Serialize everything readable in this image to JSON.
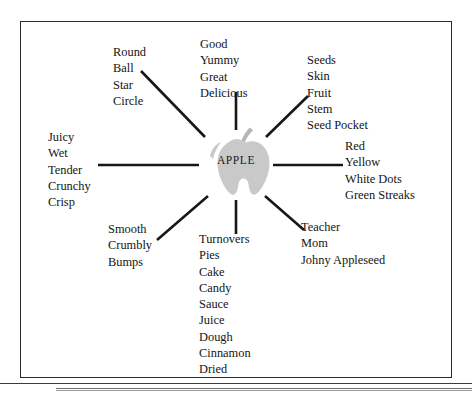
{
  "diagram": {
    "type": "semantic-web",
    "center": {
      "label": "APPLE",
      "shape": "apple-silhouette",
      "fill_color": "#c9c9c9",
      "stem_color": "#b5b5b5"
    },
    "frame": {
      "border_color": "#2b2b2b",
      "background_color": "#ffffff"
    },
    "spoke_color": "#171717",
    "spoke_count": 8,
    "branches": [
      {
        "id": "shape",
        "name": "shape-branch",
        "direction": "top-left",
        "words": [
          "Round",
          "Ball",
          "Star",
          "Circle"
        ]
      },
      {
        "id": "taste",
        "name": "taste-branch",
        "direction": "top",
        "words": [
          "Good",
          "Yummy",
          "Great",
          "Delicious"
        ]
      },
      {
        "id": "parts",
        "name": "parts-branch",
        "direction": "top-right",
        "words": [
          "Seeds",
          "Skin",
          "Fruit",
          "Stem",
          "Seed Pocket"
        ]
      },
      {
        "id": "texture",
        "name": "texture-branch",
        "direction": "left",
        "words": [
          "Juicy",
          "Wet",
          "Tender",
          "Crunchy",
          "Crisp"
        ]
      },
      {
        "id": "color",
        "name": "color-branch",
        "direction": "right",
        "words": [
          "Red",
          "Yellow",
          "White Dots",
          "Green Streaks"
        ]
      },
      {
        "id": "feel",
        "name": "feel-branch",
        "direction": "bottom-left",
        "words": [
          "Smooth",
          "Crumbly",
          "Bumps"
        ]
      },
      {
        "id": "foods",
        "name": "foods-branch",
        "direction": "bottom",
        "words": [
          "Turnovers",
          "Pies",
          "Cake",
          "Candy",
          "Sauce",
          "Juice",
          "Dough",
          "Cinnamon",
          "Dried"
        ]
      },
      {
        "id": "people",
        "name": "people-branch",
        "direction": "bottom-right",
        "words": [
          "Teacher",
          "Mom",
          "Johny Appleseed"
        ]
      }
    ]
  }
}
